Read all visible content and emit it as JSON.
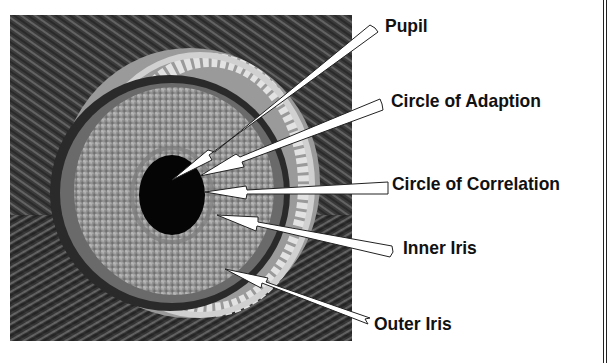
{
  "diagram": {
    "labels": [
      {
        "id": "pupil",
        "text": "Pupil"
      },
      {
        "id": "circle-of-adaption",
        "text": "Circle of Adaption"
      },
      {
        "id": "circle-of-correlation",
        "text": "Circle of Correlation"
      },
      {
        "id": "inner-iris",
        "text": "Inner Iris"
      },
      {
        "id": "outer-iris",
        "text": "Outer Iris"
      }
    ]
  },
  "colors": {
    "background": "#ffffff",
    "label_text": "#111111",
    "arrow_fill": "#ffffff",
    "arrow_stroke": "#222222"
  }
}
